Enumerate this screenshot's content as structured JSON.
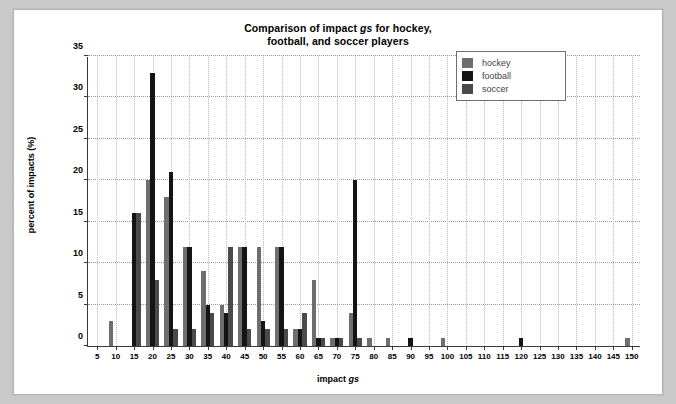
{
  "card": {
    "background": "#ffffff",
    "page_background": "#c9c9c9"
  },
  "chart_data": {
    "type": "bar",
    "title": "Comparison of impact gs for hockey, football, and soccer players",
    "title_line1": "Comparison of impact ",
    "title_line1_italic": "gs",
    "title_line1_tail": " for hockey,",
    "title_line2": "football, and soccer players",
    "xlabel": "impact gs",
    "xlabel_pre": "impact ",
    "xlabel_italic": "gs",
    "ylabel": "percent of impacts (%)",
    "xlim": [
      2.5,
      152.5
    ],
    "ylim": [
      0,
      35
    ],
    "yticks": [
      0,
      5,
      10,
      15,
      20,
      25,
      30,
      35
    ],
    "xticks": [
      5,
      10,
      15,
      20,
      25,
      30,
      35,
      40,
      45,
      50,
      55,
      60,
      65,
      70,
      75,
      80,
      85,
      90,
      95,
      100,
      105,
      110,
      115,
      120,
      125,
      130,
      135,
      140,
      145,
      150
    ],
    "grid": true,
    "legend_position": "upper-right",
    "colors": {
      "hockey": "#6e6e6e",
      "football": "#141414",
      "soccer": "#4a4a4a"
    },
    "series": [
      {
        "name": "hockey",
        "color": "#6e6e6e",
        "points": [
          {
            "x": 10,
            "y": 3
          },
          {
            "x": 20,
            "y": 20
          },
          {
            "x": 25,
            "y": 18
          },
          {
            "x": 30,
            "y": 12
          },
          {
            "x": 35,
            "y": 9
          },
          {
            "x": 40,
            "y": 5
          },
          {
            "x": 45,
            "y": 12
          },
          {
            "x": 50,
            "y": 12
          },
          {
            "x": 55,
            "y": 12
          },
          {
            "x": 60,
            "y": 2
          },
          {
            "x": 65,
            "y": 8
          },
          {
            "x": 70,
            "y": 1
          },
          {
            "x": 75,
            "y": 4
          },
          {
            "x": 80,
            "y": 1
          },
          {
            "x": 85,
            "y": 1
          },
          {
            "x": 100,
            "y": 1
          },
          {
            "x": 150,
            "y": 1
          }
        ]
      },
      {
        "name": "football",
        "color": "#141414",
        "points": [
          {
            "x": 15,
            "y": 16
          },
          {
            "x": 20,
            "y": 33
          },
          {
            "x": 25,
            "y": 21
          },
          {
            "x": 30,
            "y": 12
          },
          {
            "x": 35,
            "y": 5
          },
          {
            "x": 40,
            "y": 4
          },
          {
            "x": 45,
            "y": 12
          },
          {
            "x": 50,
            "y": 3
          },
          {
            "x": 55,
            "y": 12
          },
          {
            "x": 60,
            "y": 2
          },
          {
            "x": 65,
            "y": 1
          },
          {
            "x": 70,
            "y": 1
          },
          {
            "x": 75,
            "y": 20
          },
          {
            "x": 90,
            "y": 1
          },
          {
            "x": 120,
            "y": 1
          }
        ]
      },
      {
        "name": "soccer",
        "color": "#4a4a4a",
        "points": [
          {
            "x": 15,
            "y": 16
          },
          {
            "x": 20,
            "y": 8
          },
          {
            "x": 25,
            "y": 2
          },
          {
            "x": 30,
            "y": 2
          },
          {
            "x": 35,
            "y": 4
          },
          {
            "x": 40,
            "y": 12
          },
          {
            "x": 45,
            "y": 2
          },
          {
            "x": 50,
            "y": 2
          },
          {
            "x": 55,
            "y": 2
          },
          {
            "x": 60,
            "y": 4
          },
          {
            "x": 65,
            "y": 1
          },
          {
            "x": 70,
            "y": 1
          },
          {
            "x": 75,
            "y": 1
          }
        ]
      }
    ]
  },
  "legend": {
    "items": [
      {
        "label": "hockey",
        "color": "#6e6e6e"
      },
      {
        "label": "football",
        "color": "#141414"
      },
      {
        "label": "soccer",
        "color": "#4a4a4a"
      }
    ]
  }
}
